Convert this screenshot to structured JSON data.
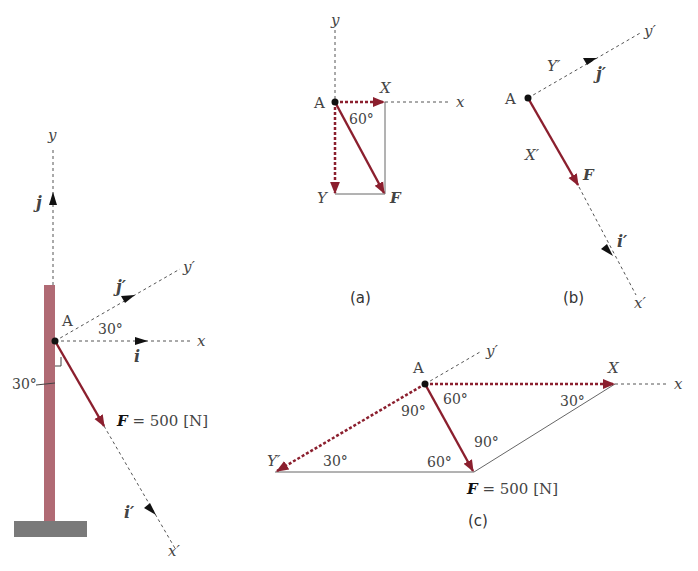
{
  "colors": {
    "force": "#8b1f2e",
    "post": "#b06a74",
    "ground": "#7a7a7a",
    "axis": "#555555",
    "text": "#444444"
  },
  "main_figure": {
    "point": "A",
    "axis_x": "x",
    "axis_y": "y",
    "axis_x_prime": "x′",
    "axis_y_prime": "y′",
    "unit_i": "i",
    "unit_j": "j",
    "unit_i_prime": "i′",
    "unit_j_prime": "j′",
    "angle_axes": "30°",
    "angle_post": "30°",
    "force_label_symbol": "F",
    "force_label_value": " = 500 [N]"
  },
  "figure_a": {
    "caption": "(a)",
    "point": "A",
    "axis_x": "x",
    "axis_y": "y",
    "component_x": "X",
    "component_y": "Y",
    "force": "F",
    "angle": "60°"
  },
  "figure_b": {
    "caption": "(b)",
    "point": "A",
    "axis_x_prime": "x′",
    "axis_y_prime": "y′",
    "component_x_prime": "X′",
    "component_y_prime": "Y′",
    "unit_i_prime": "i′",
    "unit_j_prime": "j′",
    "force": "F"
  },
  "figure_c": {
    "caption": "(c)",
    "point": "A",
    "axis_x": "x",
    "axis_y_prime": "y′",
    "component_x": "X",
    "component_y_prime": "Y′",
    "angle_top_right": "60°",
    "angle_top_left": "90°",
    "angle_x_vertex": "30°",
    "angle_y_vertex": "30°",
    "angle_f_left": "60°",
    "angle_f_right": "90°",
    "force_label_symbol": "F",
    "force_label_value": " = 500 [N]"
  }
}
